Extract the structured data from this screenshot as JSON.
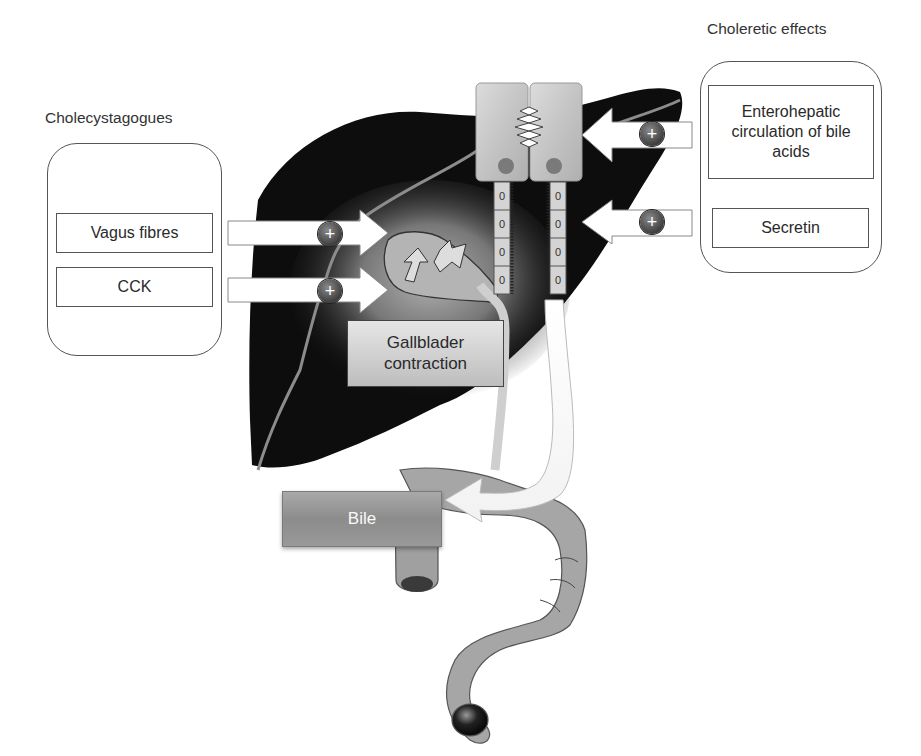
{
  "diagram": {
    "cholecystagogues": {
      "title": "Cholecystagogues",
      "factors": [
        {
          "label": "Vagus fibres",
          "effect": "+"
        },
        {
          "label": "CCK",
          "effect": "+"
        }
      ]
    },
    "choleretic": {
      "title": "Choleretic effects",
      "factors": [
        {
          "label": "Enterohepatic circulation of bile acids",
          "effect": "+"
        },
        {
          "label": "Secretin",
          "effect": "+"
        }
      ]
    },
    "gallbladder_label": "Gallblader contraction",
    "bile_label": "Bile",
    "stimulation_symbol": "+",
    "duct_cell_nuclei": [
      "0",
      "0",
      "0",
      "0",
      "0",
      "0",
      "0",
      "0"
    ],
    "colors": {
      "liver": "#0d0d0d",
      "organ_grey": "#a6a6a6",
      "hepatocyte": "#c8c8c8",
      "nucleus": "#7a7a7a",
      "plus_badge": "#3e3e3e",
      "frame": "#555555"
    }
  }
}
